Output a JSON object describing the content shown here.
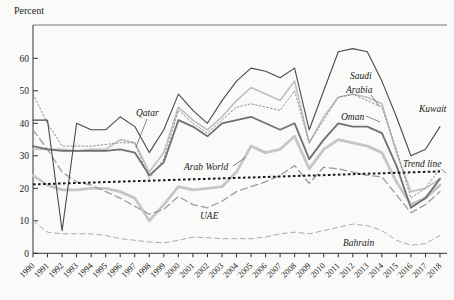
{
  "chart_data": {
    "type": "line",
    "title": "",
    "ylabel": "Percent",
    "xlabel": "",
    "grid": false,
    "legend_position": "inline-annotations",
    "ylim": [
      0,
      65
    ],
    "yticks": [
      0,
      10,
      20,
      30,
      40,
      50,
      60
    ],
    "x": [
      1990,
      1991,
      1992,
      1993,
      1994,
      1995,
      1996,
      1997,
      1998,
      1999,
      2000,
      2001,
      2002,
      2003,
      2004,
      2005,
      2006,
      2007,
      2008,
      2009,
      2010,
      2011,
      2012,
      2013,
      2014,
      2015,
      2016,
      2017,
      2018
    ],
    "series": [
      {
        "name": "Arab World",
        "color": "#c6c6c6",
        "width": 2.8,
        "dash": null,
        "values": [
          24,
          21,
          19.5,
          19.5,
          20,
          20,
          19,
          17,
          10,
          15,
          20.5,
          19.5,
          20,
          20.5,
          25,
          33,
          31,
          32,
          36,
          26,
          32,
          35,
          34,
          33,
          31,
          22,
          15,
          17,
          21
        ]
      },
      {
        "name": "Qatar",
        "color": "#bfbfbf",
        "width": 1.6,
        "dash": null,
        "values": [
          32,
          32,
          32,
          31.5,
          32,
          32,
          35,
          34,
          25,
          31,
          45,
          41,
          38,
          42,
          47,
          51,
          49,
          47,
          53,
          34,
          42,
          48,
          49,
          48,
          46,
          31,
          19,
          20,
          23
        ]
      },
      {
        "name": "UAE",
        "color": "#9c9c9c",
        "width": 1.3,
        "dash": "7,4",
        "values": [
          38,
          32,
          25,
          22,
          21,
          19,
          17,
          14.5,
          12,
          13.5,
          17.5,
          15,
          14,
          16,
          19,
          20.5,
          22,
          24,
          27,
          21.5,
          26.5,
          26,
          25,
          24,
          23.5,
          18,
          12.5,
          15,
          19
        ]
      },
      {
        "name": "Bahrain",
        "color": "#ababab",
        "width": 1,
        "dash": "5,3.5",
        "values": [
          10,
          6.5,
          6,
          6,
          6,
          5.5,
          4.5,
          4,
          3.5,
          3.2,
          4,
          5,
          4.8,
          4.5,
          4.5,
          4.5,
          5,
          6,
          6.5,
          6,
          7,
          8,
          9,
          8.5,
          7,
          4,
          2.5,
          3,
          5.5
        ]
      },
      {
        "name": "Saudi Arabia",
        "color": "#8f8f8f",
        "width": 1,
        "dash": "1.6,2.2",
        "values": [
          49,
          40,
          33,
          33,
          33,
          33.5,
          34,
          34,
          23,
          29,
          44,
          40,
          37,
          41,
          45,
          46,
          45,
          44,
          50,
          34,
          41,
          48,
          49,
          47,
          45,
          32,
          17,
          20,
          26
        ]
      },
      {
        "name": "Oman",
        "color": "#707070",
        "width": 1.8,
        "dash": null,
        "values": [
          33,
          32,
          31.5,
          31.5,
          31.5,
          31.5,
          32,
          31,
          24,
          28,
          41,
          39,
          36,
          40,
          41,
          42,
          40,
          38,
          40,
          29,
          35,
          40,
          39,
          39,
          37,
          27,
          14,
          17,
          23
        ]
      },
      {
        "name": "Kuwait",
        "color": "#4a4a4a",
        "width": 1.1,
        "dash": null,
        "values": [
          41,
          41,
          7,
          40,
          38,
          38,
          42,
          39,
          31,
          38,
          49,
          44,
          40,
          47,
          53,
          57,
          56,
          54,
          57,
          38,
          50,
          62,
          63,
          62,
          53,
          42,
          30,
          32,
          39
        ]
      }
    ],
    "trend": {
      "label": "Trend line",
      "color": "#1a1a1a",
      "width": 2,
      "dash": "2.6,2.4",
      "start_value": 21.2,
      "end_value": 25.2
    },
    "annotations": [
      {
        "text": "Qatar",
        "x": 136,
        "y": 116,
        "leader": [
          147,
          119,
          136,
          147
        ]
      },
      {
        "text": "Arab World",
        "x": 184,
        "y": 170,
        "leader": [
          233,
          166,
          246,
          157
        ]
      },
      {
        "text": "UAE",
        "x": 200,
        "y": 219,
        "leader": null
      },
      {
        "text": "Saudi",
        "x": 350,
        "y": 79,
        "leader": null
      },
      {
        "text": "Arabia",
        "x": 346,
        "y": 93,
        "leader": [
          371,
          95,
          379,
          106
        ]
      },
      {
        "text": "Oman",
        "x": 341,
        "y": 120,
        "leader": [
          366,
          116,
          380,
          122
        ]
      },
      {
        "text": "Kuwait",
        "x": 419,
        "y": 112,
        "leader": null
      },
      {
        "text": "Trend line",
        "x": 403,
        "y": 167,
        "leader": [
          441,
          169,
          446,
          173
        ]
      },
      {
        "text": "Bahrain",
        "x": 343,
        "y": 246,
        "leader": null
      }
    ]
  }
}
